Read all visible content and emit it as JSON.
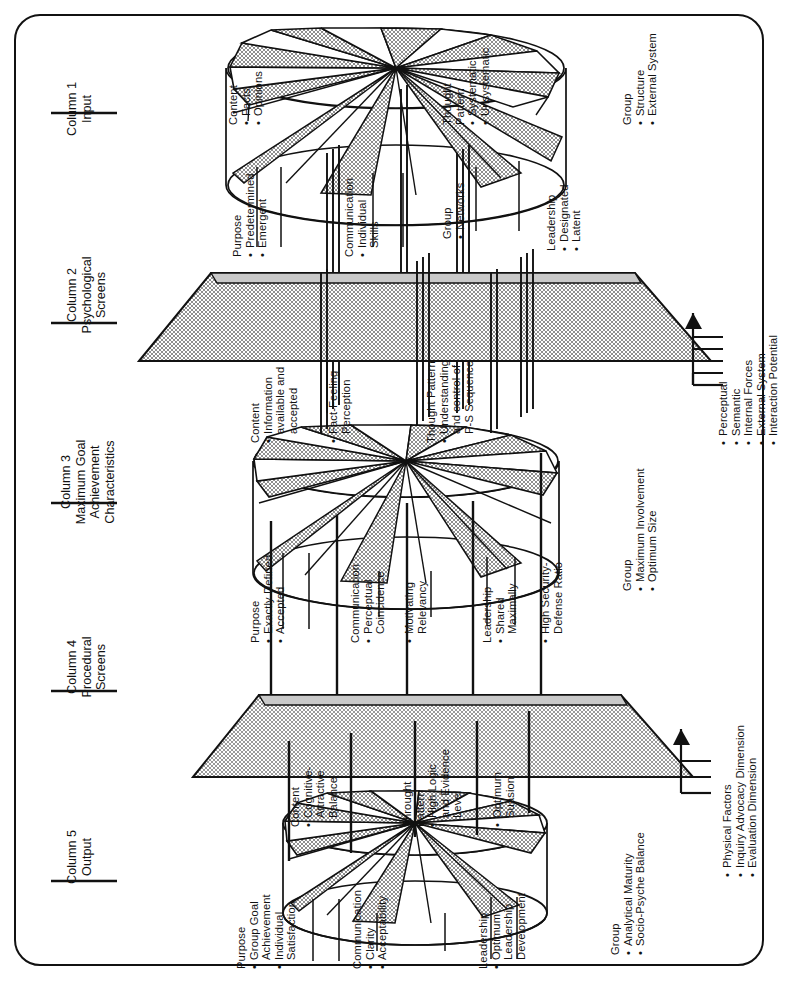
{
  "diagram": {
    "frame": {
      "shape": "rounded-rectangle",
      "border_color": "#111111"
    },
    "colors": {
      "ink": "#111111",
      "screen_fill": "#b2b2b2",
      "wedge_fill": "#b2b2b2",
      "paper": "#ffffff"
    }
  },
  "columns": [
    {
      "id": "col1",
      "number": "Column 1",
      "name": "Input",
      "kind": "disc"
    },
    {
      "id": "col2",
      "number": "Column 2",
      "name": "Psychological\nScreens",
      "name_lines": [
        "Psychological",
        "Screens"
      ],
      "kind": "screen"
    },
    {
      "id": "col3",
      "number": "Column 3",
      "name_lines": [
        "Maximum Goal",
        "Achievement",
        "Characteristics"
      ],
      "kind": "disc"
    },
    {
      "id": "col4",
      "number": "Column 4",
      "name_lines": [
        "Procedural",
        "Screens"
      ],
      "kind": "screen"
    },
    {
      "id": "col5",
      "number": "Column 5",
      "name_lines": [
        "Output"
      ],
      "kind": "disc"
    }
  ],
  "col1_groups": [
    {
      "head": "Purpose",
      "items": [
        "Predetermined",
        "Emergent"
      ]
    },
    {
      "head": "Communication",
      "items": [
        "Individual",
        "Skills"
      ],
      "item_wrapped": true
    },
    {
      "head": "Group",
      "items": [
        "Networks"
      ]
    },
    {
      "head": "Leadership",
      "items": [
        "Designated",
        "Latent"
      ]
    },
    {
      "head": "Content",
      "items": [
        "Facts",
        "Opinions"
      ]
    },
    {
      "head_lines": [
        "Thought",
        "Pattern"
      ],
      "head": "Thought Pattern",
      "items": [
        "Systematic",
        "Unsystematic"
      ]
    },
    {
      "head": "Group",
      "items": [
        "Structure",
        "External System"
      ]
    }
  ],
  "col2_screen_inputs": [
    "Perceptual",
    "Semantic",
    "Internal Forces",
    "External System",
    "Interaction Potential"
  ],
  "col3_groups": [
    {
      "head": "Purpose",
      "items": [
        "Exactly Defined",
        "Accepted"
      ]
    },
    {
      "head": "Communication",
      "items": [
        "Perceptual",
        "Coincidence"
      ],
      "item_wrapped": true
    },
    {
      "head": "",
      "items": [
        "Motivating",
        "Relevancy"
      ],
      "item_wrapped": true
    },
    {
      "head": "Leadership",
      "items": [
        "Shared",
        "Maximally"
      ],
      "item_wrapped": true
    },
    {
      "head": "",
      "items": [
        "High Security-",
        "Defense Ratio"
      ],
      "item_wrapped": true
    },
    {
      "head": "Group",
      "items": [
        "Maximum Involvement",
        "Optimum Size"
      ]
    },
    {
      "head": "Content",
      "items": [
        "Information",
        "available and",
        "accepted"
      ],
      "item_wrapped": true
    },
    {
      "head": "",
      "items": [
        "Fact-Feeling",
        "Perception"
      ],
      "item_wrapped": true
    },
    {
      "head_lines": [
        "Thought Pattern"
      ],
      "head": "Thought Pattern",
      "items": [
        "Understanding",
        "and control of",
        "P-S Sequence"
      ],
      "item_wrapped": true
    }
  ],
  "col4_screen_inputs": [
    "Physical Factors",
    "Inquiry Advocacy Dimension",
    "Evaluation Dimension"
  ],
  "col5_groups": [
    {
      "head": "Purpose",
      "items": [
        "Group Goal",
        "Achievement",
        "Individual",
        "Satisfaction"
      ],
      "item_wrapped": true
    },
    {
      "head": "Communication",
      "items": [
        "Clarity",
        "Acceptability"
      ]
    },
    {
      "head": "Leadership",
      "items": [
        "Optimum",
        "Leadership",
        "Development"
      ],
      "item_wrapped": true
    },
    {
      "head": "Group",
      "items": [
        "Analytical Maturity",
        "Socio-Psyche Balance"
      ]
    },
    {
      "head": "Content",
      "items": [
        "Cognitive-",
        "Attractive",
        "Balance"
      ],
      "item_wrapped": true
    },
    {
      "head_lines": [
        "Throught",
        "Pattern"
      ],
      "head": "Throught Pattern",
      "items": [
        "High Logic",
        "and Evidence",
        "Level"
      ],
      "item_wrapped": true
    },
    {
      "head": "",
      "items": [
        "Optimum",
        "Suasion"
      ],
      "item_wrapped": true
    }
  ]
}
